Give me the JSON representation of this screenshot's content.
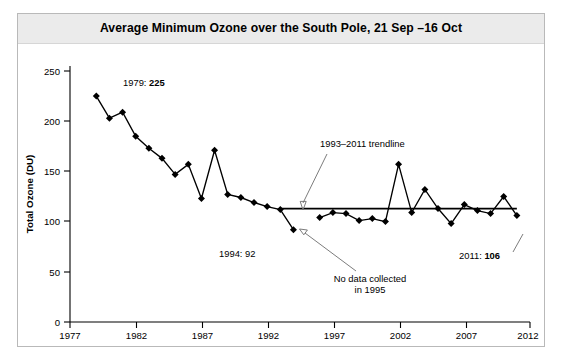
{
  "chart_data": {
    "type": "line",
    "title": "Average Minimum Ozone over the South Pole, 21 Sep –16 Oct",
    "xlabel": "Year",
    "ylabel": "Total Ozone (DU)",
    "xlim": [
      1977,
      2012
    ],
    "ylim": [
      0,
      250
    ],
    "xticks": [
      1977,
      1982,
      1987,
      1992,
      1997,
      2002,
      2007,
      2012
    ],
    "yticks": [
      0,
      50,
      100,
      150,
      200,
      250
    ],
    "grid": false,
    "legend": "none",
    "x": [
      1979,
      1980,
      1981,
      1982,
      1983,
      1984,
      1985,
      1986,
      1987,
      1988,
      1989,
      1990,
      1991,
      1992,
      1993,
      1994,
      1996,
      1997,
      1998,
      1999,
      2000,
      2001,
      2002,
      2003,
      2004,
      2005,
      2006,
      2007,
      2008,
      2009,
      2010,
      2011
    ],
    "values": [
      225,
      203,
      209,
      185,
      173,
      163,
      147,
      157,
      123,
      171,
      127,
      124,
      119,
      115,
      112,
      92,
      104,
      109,
      108,
      101,
      103,
      100,
      157,
      109,
      132,
      113,
      98,
      117,
      111,
      108,
      125,
      106
    ],
    "missing_years": [
      1995
    ],
    "series": [
      {
        "name": "Average minimum ozone",
        "x": [
          1979,
          1980,
          1981,
          1982,
          1983,
          1984,
          1985,
          1986,
          1987,
          1988,
          1989,
          1990,
          1991,
          1992,
          1993,
          1994,
          1996,
          1997,
          1998,
          1999,
          2000,
          2001,
          2002,
          2003,
          2004,
          2005,
          2006,
          2007,
          2008,
          2009,
          2010,
          2011
        ],
        "values": [
          225,
          203,
          209,
          185,
          173,
          163,
          147,
          157,
          123,
          171,
          127,
          124,
          119,
          115,
          112,
          92,
          104,
          109,
          108,
          101,
          103,
          100,
          157,
          109,
          132,
          113,
          98,
          117,
          111,
          108,
          125,
          106
        ]
      },
      {
        "name": "1993–2011 trendline",
        "x": [
          1993,
          2011
        ],
        "values": [
          113,
          113
        ]
      }
    ],
    "annotations": [
      {
        "id": "first-point",
        "prefix": "1979: ",
        "value": "225",
        "bold_value": true
      },
      {
        "id": "trendline",
        "text": "1993–2011 trendline"
      },
      {
        "id": "minimum-point",
        "prefix": "1994: ",
        "value": "92",
        "bold_value": false
      },
      {
        "id": "no-data",
        "line1": "No data collected",
        "line2": "in 1995"
      },
      {
        "id": "last-point",
        "prefix": "2011: ",
        "value": "106",
        "bold_value": true
      }
    ]
  },
  "axis": {
    "y_labels": [
      "250",
      "200",
      "150",
      "100",
      "50",
      "0"
    ],
    "x_labels": [
      "1977",
      "1982",
      "1987",
      "1992",
      "1997",
      "2002",
      "2007",
      "2012"
    ],
    "x_title": "Year",
    "y_title": "Total Ozone (DU)"
  },
  "colors": {
    "line": "#000000",
    "marker": "#000000",
    "trendline": "#000000",
    "leader": "#6d6d6d",
    "title_band": "#ebebeb",
    "frame_border": "#b9b9b9",
    "background": "#ffffff"
  }
}
